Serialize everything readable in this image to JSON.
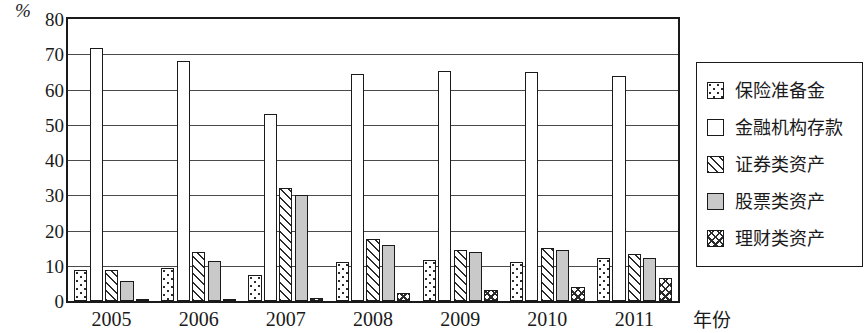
{
  "chart_data": {
    "type": "bar",
    "title": "",
    "xlabel": "年份",
    "ylabel": "%",
    "ylim": [
      0,
      80
    ],
    "yticks": [
      0,
      10,
      20,
      30,
      40,
      50,
      60,
      70,
      80
    ],
    "grid": true,
    "legend_position": "right",
    "categories": [
      "2005",
      "2006",
      "2007",
      "2008",
      "2009",
      "2010",
      "2011"
    ],
    "series": [
      {
        "name": "保险准备金",
        "pattern": "dots",
        "values": [
          8.8,
          9.3,
          7.5,
          11.0,
          11.5,
          11.2,
          12.3
        ]
      },
      {
        "name": "金融机构存款",
        "pattern": "open",
        "values": [
          71.8,
          68.2,
          53.0,
          64.5,
          65.2,
          65.0,
          63.8
        ]
      },
      {
        "name": "证券类资产",
        "pattern": "diag",
        "values": [
          8.8,
          13.8,
          32.0,
          17.5,
          14.5,
          15.0,
          13.3
        ]
      },
      {
        "name": "股票类资产",
        "pattern": "gray",
        "values": [
          5.8,
          11.3,
          30.2,
          16.0,
          14.0,
          14.5,
          12.2
        ]
      },
      {
        "name": "理财类资产",
        "pattern": "cross",
        "values": [
          0.5,
          0.6,
          0.8,
          2.2,
          3.0,
          3.9,
          6.5
        ]
      }
    ]
  }
}
